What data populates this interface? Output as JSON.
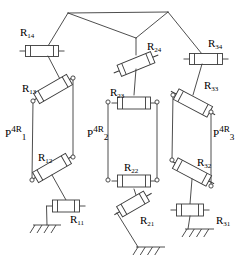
{
  "figure": {
    "name": "3-leg parallelogram (P-4R) parallel mechanism kinematic diagram",
    "stroke_color": "#3a3a3a",
    "fill_color": "#ffffff",
    "background": "#ffffff",
    "width": 243,
    "height": 270
  },
  "labels": {
    "R14": {
      "text": "R",
      "sub": "14",
      "x": 20,
      "y": 27
    },
    "R13": {
      "text": "R",
      "sub": "13",
      "x": 22,
      "y": 83
    },
    "R12": {
      "text": "R",
      "sub": "12",
      "x": 38,
      "y": 152
    },
    "R11": {
      "text": "R",
      "sub": "11",
      "x": 70,
      "y": 214
    },
    "R24": {
      "text": "R",
      "sub": "24",
      "x": 147,
      "y": 41
    },
    "R23": {
      "text": "R",
      "sub": "23",
      "x": 110,
      "y": 87
    },
    "R22": {
      "text": "R",
      "sub": "22",
      "x": 124,
      "y": 162
    },
    "R21": {
      "text": "R",
      "sub": "21",
      "x": 140,
      "y": 215
    },
    "R34": {
      "text": "R",
      "sub": "34",
      "x": 208,
      "y": 38
    },
    "R33": {
      "text": "R",
      "sub": "33",
      "x": 204,
      "y": 80
    },
    "R32": {
      "text": "R",
      "sub": "32",
      "x": 197,
      "y": 157
    },
    "R31": {
      "text": "R",
      "sub": "31",
      "x": 216,
      "y": 215
    }
  },
  "leg_labels": {
    "P1": {
      "text": "P",
      "sup": "4R",
      "sub": "1",
      "x": 5,
      "y": 125
    },
    "P2": {
      "text": "P",
      "sup": "4R",
      "sub": "2",
      "x": 87,
      "y": 125
    },
    "P3": {
      "text": "P",
      "sup": "4R",
      "sub": "3",
      "x": 213,
      "y": 125
    }
  },
  "geometry": {
    "platform": {
      "left_vertex": [
        68,
        13
      ],
      "right_vertex": [
        168,
        12
      ],
      "center_joint": [
        136,
        38
      ]
    },
    "legs": [
      {
        "id": "leg-1",
        "top_bar": {
          "cx": 42,
          "cy": 51,
          "w": 33,
          "h": 11,
          "angle": 0
        },
        "parallelogram": [
          [
            33,
            101
          ],
          [
            73,
            78
          ],
          [
            73,
            157
          ],
          [
            32,
            180
          ]
        ],
        "upper_coupler": {
          "cx": 53,
          "cy": 89,
          "w": 38,
          "h": 12,
          "angle": -30
        },
        "lower_coupler": {
          "cx": 52,
          "cy": 168,
          "w": 38,
          "h": 12,
          "angle": -30
        },
        "base_bar": {
          "cx": 66,
          "cy": 206,
          "w": 27,
          "h": 12,
          "angle": 0
        },
        "ground": {
          "x": 33,
          "y": 225,
          "w": 28
        }
      },
      {
        "id": "leg-2",
        "top_bar": {
          "cx": 136,
          "cy": 64,
          "w": 36,
          "h": 12,
          "angle": -22
        },
        "parallelogram": [
          [
            108,
            102
          ],
          [
            157,
            102
          ],
          [
            157,
            180
          ],
          [
            108,
            180
          ]
        ],
        "upper_coupler": {
          "cx": 134,
          "cy": 103,
          "w": 33,
          "h": 12,
          "angle": 0
        },
        "lower_coupler": {
          "cx": 134,
          "cy": 181,
          "w": 33,
          "h": 12,
          "angle": 0
        },
        "base_bar": {
          "cx": 133,
          "cy": 204,
          "w": 31,
          "h": 12,
          "angle": -30
        },
        "ground": {
          "x": 136,
          "y": 247,
          "w": 29
        }
      },
      {
        "id": "leg-3",
        "top_bar": {
          "cx": 206,
          "cy": 59,
          "w": 33,
          "h": 11,
          "angle": 0
        },
        "parallelogram": [
          [
            173,
            95
          ],
          [
            211,
            112
          ],
          [
            211,
            186
          ],
          [
            172,
            160
          ]
        ],
        "upper_coupler": {
          "cx": 193,
          "cy": 103,
          "w": 38,
          "h": 12,
          "angle": 28
        },
        "lower_coupler": {
          "cx": 192,
          "cy": 172,
          "w": 38,
          "h": 12,
          "angle": 28
        },
        "base_bar": {
          "cx": 190,
          "cy": 210,
          "w": 27,
          "h": 12,
          "angle": 0
        },
        "ground": {
          "x": 185,
          "y": 229,
          "w": 29
        }
      }
    ]
  }
}
